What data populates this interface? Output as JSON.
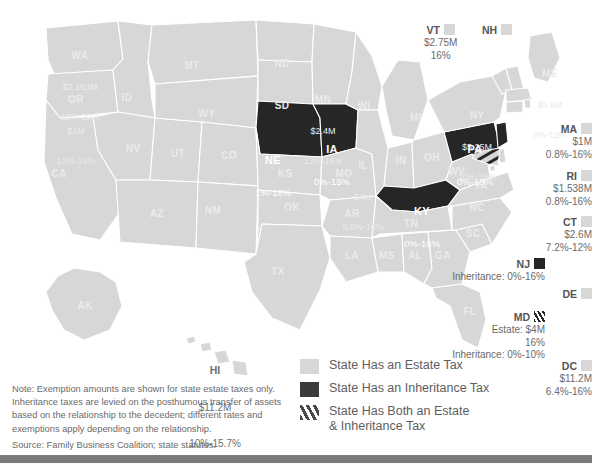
{
  "colors": {
    "estate": "#d7d7d7",
    "inheritance": "#262626",
    "both_stripe": "#4a4a4a",
    "background": "#ffffff",
    "border": "#ffffff",
    "text": "#6a6a6a",
    "footer_bar": "#7a7a7a"
  },
  "map": {
    "title": "",
    "estate_states": [
      {
        "abbr": "WA",
        "exemption": "$2.193M",
        "rate": "10%-20%"
      },
      {
        "abbr": "OR",
        "exemption": "$1M",
        "rate": "10%-16%"
      },
      {
        "abbr": "MN",
        "exemption": "$2.4M",
        "rate": "13%-16%"
      },
      {
        "abbr": "IL",
        "exemption": "$4M",
        "rate": "0.8%-16%"
      },
      {
        "abbr": "NY",
        "exemption": "$5.25M",
        "rate": "10%-16%"
      },
      {
        "abbr": "ME",
        "exemption": "$5.6M",
        "rate": "8%-12%"
      },
      {
        "abbr": "HI",
        "exemption": "$11.2M",
        "rate": "10%-15.7%"
      }
    ],
    "inheritance_states": [
      {
        "abbr": "NE",
        "rate": "1%-18%"
      },
      {
        "abbr": "IA",
        "rate": "0%-15%"
      },
      {
        "abbr": "KY",
        "rate": "0%-16%"
      },
      {
        "abbr": "PA",
        "rate": "0%-15%"
      }
    ],
    "plain_states": [
      "ID",
      "MT",
      "ND",
      "SD",
      "WY",
      "NV",
      "UT",
      "CO",
      "CA",
      "AZ",
      "NM",
      "KS",
      "OK",
      "TX",
      "MO",
      "AR",
      "LA",
      "MS",
      "AL",
      "TN",
      "GA",
      "FL",
      "SC",
      "NC",
      "VA",
      "WV",
      "OH",
      "IN",
      "MI",
      "WI",
      "AK"
    ]
  },
  "callouts": [
    {
      "abbr": "VT",
      "swatch": "estate",
      "lines": [
        "$2.75M",
        "16%"
      ],
      "align": "center",
      "x": 424,
      "y": 24
    },
    {
      "abbr": "NH",
      "swatch": "estate",
      "lines": [],
      "align": "center",
      "x": 482,
      "y": 24
    },
    {
      "abbr": "MA",
      "swatch": "estate",
      "lines": [
        "$1M",
        "0.8%-16%"
      ],
      "align": "right",
      "x": 502,
      "y": 123
    },
    {
      "abbr": "RI",
      "swatch": "estate",
      "lines": [
        "$1.538M",
        "0.8%-16%"
      ],
      "align": "right",
      "x": 502,
      "y": 170
    },
    {
      "abbr": "CT",
      "swatch": "estate",
      "lines": [
        "$2.6M",
        "7.2%-12%"
      ],
      "align": "right",
      "x": 502,
      "y": 216
    },
    {
      "abbr": "NJ",
      "swatch": "inheritance",
      "lines": [
        "Inheritance: 0%-16%"
      ],
      "align": "right",
      "x": 455,
      "y": 258
    },
    {
      "abbr": "DE",
      "swatch": "estate",
      "lines": [],
      "align": "right",
      "x": 502,
      "y": 288
    },
    {
      "abbr": "MD",
      "swatch": "both",
      "lines": [
        "Estate: $4M",
        "16%",
        "Inheritance: 0%-10%"
      ],
      "align": "right",
      "x": 455,
      "y": 311
    },
    {
      "abbr": "DC",
      "swatch": "estate",
      "lines": [
        "$11.2M",
        "6.4%-16%"
      ],
      "align": "right",
      "x": 502,
      "y": 360
    }
  ],
  "legend": {
    "items": [
      {
        "key": "estate",
        "label": "State Has an Estate Tax"
      },
      {
        "key": "inherit",
        "label": "State Has an Inheritance Tax"
      },
      {
        "key": "both",
        "label": "State Has Both an Estate\n& Inheritance Tax"
      }
    ]
  },
  "note": {
    "body": "Note: Exemption amounts are shown for state estate taxes only. Inheritance taxes are levied on the posthumous transfer of assets based on the relationship to the decedent; different rates and exemptions apply depending on the relationship.",
    "source": "Source: Family Business Coalition; state statutes."
  }
}
